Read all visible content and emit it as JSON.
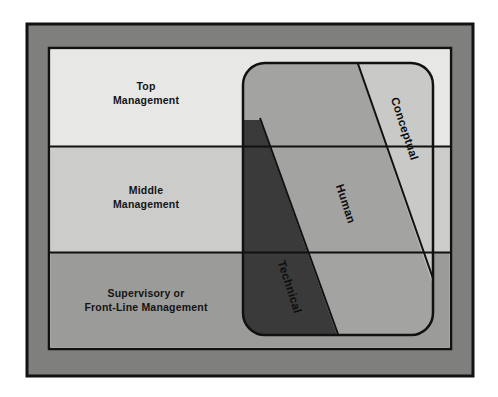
{
  "diagram": {
    "type": "layered-skills-diagram",
    "levels": [
      {
        "id": "top",
        "label_line1": "Top",
        "label_line2": "Management",
        "fill": "#e7e7e5",
        "y": 48,
        "height": 98
      },
      {
        "id": "middle",
        "label_line1": "Middle",
        "label_line2": "Management",
        "fill": "#cccccb",
        "y": 146,
        "height": 107
      },
      {
        "id": "supervisory",
        "label_line1": "Supervisory or",
        "label_line2": "Front-Line Management",
        "fill": "#9b9b99",
        "y": 253,
        "height": 96
      }
    ],
    "skills": [
      {
        "id": "technical",
        "label": "Technical",
        "fill": "#3a3a3a",
        "text_color": "#0d0d0d",
        "rotation": 72
      },
      {
        "id": "human",
        "label": "Human",
        "fill": "#a3a3a1",
        "text_color": "#0d0d0d",
        "rotation": 72
      },
      {
        "id": "conceptual",
        "label": "Conceptual",
        "fill": "#c9c9c7",
        "text_color": "#0d0d0d",
        "rotation": 72
      }
    ],
    "frame": {
      "outer_fill": "#ffffff",
      "border_fill": "#7f7f7d",
      "stroke": "#111111",
      "outer_rect": {
        "x": 27,
        "y": 24,
        "width": 446,
        "height": 352
      },
      "inner_rect": {
        "x": 49,
        "y": 48,
        "width": 402,
        "height": 301
      }
    },
    "overlay": {
      "id": "skill-mix-panel",
      "x": 243,
      "y": 63,
      "width": 190,
      "height": 272,
      "corner_radius": 22,
      "stroke": "#111111"
    }
  }
}
